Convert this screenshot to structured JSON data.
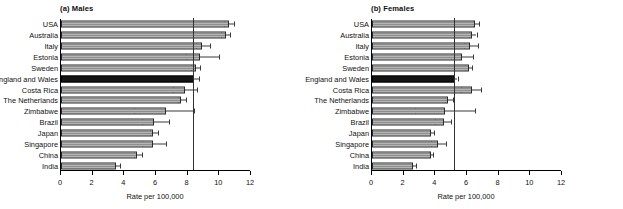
{
  "figure": {
    "panels": [
      {
        "key": "males",
        "title": "(a) Males",
        "xlabel": "Rate per 100,000",
        "reference_line": 8.4
      },
      {
        "key": "females",
        "title": "(b) Females",
        "xlabel": "Rate per 100,000",
        "reference_line": 5.25
      }
    ]
  },
  "chart_data": [
    {
      "type": "bar",
      "orientation": "horizontal",
      "title": "(a) Males",
      "xlabel": "Rate per 100,000",
      "ylabel": "",
      "xlim": [
        0,
        12
      ],
      "xticks": [
        0,
        2,
        4,
        6,
        8,
        10,
        12
      ],
      "xtick_labels": [
        "0",
        "2",
        "4",
        "6",
        "8",
        "10",
        "12"
      ],
      "grid": false,
      "legend": "none",
      "reference_line": 8.4,
      "highlight_category": "England and Wales",
      "categories": [
        "USA",
        "Australia",
        "Italy",
        "Estonia",
        "Sweden",
        "England and Wales",
        "Costa Rica",
        "The Netherlands",
        "Zimbabwe",
        "Brazil",
        "Japan",
        "Singapore",
        "China",
        "India"
      ],
      "values": [
        10.6,
        10.4,
        8.9,
        8.8,
        8.5,
        8.4,
        7.8,
        7.6,
        6.6,
        5.9,
        5.8,
        5.8,
        4.8,
        3.5
      ],
      "error_low": [
        10.3,
        10.1,
        8.5,
        7.9,
        8.2,
        8.2,
        7.1,
        7.4,
        4.6,
        5.1,
        5.6,
        5.1,
        4.6,
        3.4
      ],
      "error_high": [
        10.9,
        10.7,
        9.4,
        10.0,
        8.8,
        8.7,
        8.6,
        7.9,
        8.4,
        6.8,
        6.1,
        6.6,
        5.1,
        3.7
      ]
    },
    {
      "type": "bar",
      "orientation": "horizontal",
      "title": "(b) Females",
      "xlabel": "Rate per 100,000",
      "ylabel": "",
      "xlim": [
        0,
        12
      ],
      "xticks": [
        0,
        2,
        4,
        6,
        8,
        10,
        12
      ],
      "xtick_labels": [
        "0",
        "2",
        "4",
        "6",
        "8",
        "10",
        "12"
      ],
      "grid": false,
      "legend": "none",
      "reference_line": 5.25,
      "highlight_category": "England and Wales",
      "categories": [
        "USA",
        "Australia",
        "Italy",
        "Estonia",
        "Sweden",
        "England and Wales",
        "Costa Rica",
        "The Netherlands",
        "Zimbabwe",
        "Brazil",
        "Japan",
        "Singapore",
        "China",
        "India"
      ],
      "values": [
        6.5,
        6.3,
        6.2,
        5.7,
        6.1,
        5.25,
        6.3,
        4.8,
        4.6,
        4.55,
        3.75,
        4.15,
        3.7,
        2.6
      ],
      "error_low": [
        6.35,
        6.1,
        5.8,
        5.0,
        5.9,
        5.15,
        5.6,
        4.6,
        2.7,
        3.95,
        3.65,
        3.7,
        3.6,
        2.5
      ],
      "error_high": [
        6.75,
        6.6,
        6.7,
        6.4,
        6.3,
        5.4,
        6.9,
        5.1,
        6.5,
        5.0,
        3.9,
        4.7,
        3.85,
        2.75
      ]
    }
  ]
}
